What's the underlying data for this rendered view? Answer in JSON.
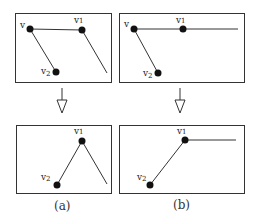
{
  "diagram": {
    "panels": [
      {
        "id": "a",
        "caption": "(a)",
        "before": {
          "vertices": [
            {
              "label": "v",
              "sub": "",
              "x": 30,
              "y": 29
            },
            {
              "label": "v",
              "sub": "1",
              "x": 82,
              "y": 30
            },
            {
              "label": "v",
              "sub": "2",
              "x": 56,
              "y": 72
            }
          ],
          "edges": [
            "v-v1",
            "v-v2",
            "v1-open-end"
          ]
        },
        "after": {
          "vertices": [
            {
              "label": "v",
              "sub": "1",
              "x": 82,
              "y": 141
            },
            {
              "label": "v",
              "sub": "2",
              "x": 57,
              "y": 185
            }
          ],
          "edges": [
            "v2-v1",
            "v1-open-end"
          ]
        }
      },
      {
        "id": "b",
        "caption": "(b)",
        "before": {
          "vertices": [
            {
              "label": "v",
              "sub": "",
              "x": 134,
              "y": 29
            },
            {
              "label": "v",
              "sub": "1",
              "x": 183,
              "y": 29
            },
            {
              "label": "v",
              "sub": "2",
              "x": 158,
              "y": 73
            }
          ],
          "edges": [
            "v-v1",
            "v1-open-end",
            "v-v2"
          ]
        },
        "after": {
          "vertices": [
            {
              "label": "v",
              "sub": "1",
              "x": 185,
              "y": 140
            },
            {
              "label": "v",
              "sub": "2",
              "x": 150,
              "y": 185
            }
          ],
          "edges": [
            "v2-v1",
            "v1-open-end"
          ]
        }
      }
    ],
    "arrow": "down-transform-arrow"
  }
}
